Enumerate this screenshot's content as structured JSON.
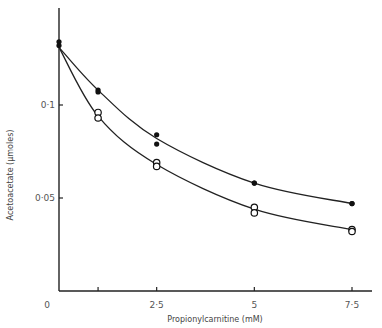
{
  "chart_data": {
    "type": "scatter",
    "title": "",
    "xlabel": "Propionylcarnitine  (mM)",
    "ylabel": "Acetoacetate  (µmoles)",
    "xlim": [
      0,
      8
    ],
    "ylim": [
      0,
      0.14
    ],
    "x_ticks": [
      {
        "value": 0,
        "label": "0"
      },
      {
        "value": 1,
        "label": ""
      },
      {
        "value": 2.5,
        "label": "2·5"
      },
      {
        "value": 5,
        "label": "5"
      },
      {
        "value": 7.5,
        "label": "7·5"
      }
    ],
    "y_ticks": [
      {
        "value": 0.05,
        "label": "0·05"
      },
      {
        "value": 0.1,
        "label": "0·1"
      }
    ],
    "origin_label": "0",
    "grid": false,
    "legend": null,
    "series": [
      {
        "name": "filled circles",
        "marker": "filled-circle",
        "points": [
          {
            "x": 0,
            "y": 0.134
          },
          {
            "x": 0,
            "y": 0.132
          },
          {
            "x": 1,
            "y": 0.108
          },
          {
            "x": 1,
            "y": 0.107
          },
          {
            "x": 2.5,
            "y": 0.084
          },
          {
            "x": 2.5,
            "y": 0.079
          },
          {
            "x": 5,
            "y": 0.058
          },
          {
            "x": 5,
            "y": 0.058
          },
          {
            "x": 7.5,
            "y": 0.047
          },
          {
            "x": 7.5,
            "y": 0.047
          }
        ],
        "curve": [
          {
            "x": 0,
            "y": 0.131
          },
          {
            "x": 1,
            "y": 0.108
          },
          {
            "x": 2.5,
            "y": 0.082
          },
          {
            "x": 5,
            "y": 0.058
          },
          {
            "x": 7.5,
            "y": 0.047
          }
        ]
      },
      {
        "name": "open circles",
        "marker": "open-circle",
        "points": [
          {
            "x": 1,
            "y": 0.096
          },
          {
            "x": 1,
            "y": 0.093
          },
          {
            "x": 2.5,
            "y": 0.069
          },
          {
            "x": 2.5,
            "y": 0.067
          },
          {
            "x": 5,
            "y": 0.045
          },
          {
            "x": 5,
            "y": 0.042
          },
          {
            "x": 7.5,
            "y": 0.033
          },
          {
            "x": 7.5,
            "y": 0.032
          }
        ],
        "curve": [
          {
            "x": 0,
            "y": 0.131
          },
          {
            "x": 1,
            "y": 0.094
          },
          {
            "x": 2.5,
            "y": 0.068
          },
          {
            "x": 5,
            "y": 0.044
          },
          {
            "x": 7.5,
            "y": 0.033
          }
        ]
      }
    ]
  }
}
